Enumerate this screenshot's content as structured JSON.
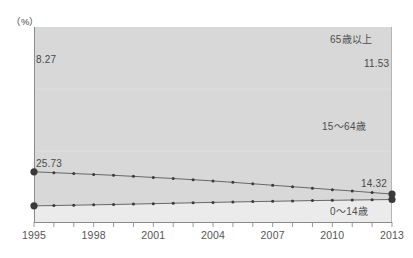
{
  "chart_data": {
    "type": "line",
    "title": "",
    "subtitle": "",
    "xlabel": "",
    "ylabel": "",
    "unit_label": "（%）",
    "grid": false,
    "legend_position": "inline-annotation",
    "x": [
      1995,
      1996,
      1997,
      1998,
      1999,
      2000,
      2001,
      2002,
      2003,
      2004,
      2005,
      2006,
      2007,
      2008,
      2009,
      2010,
      2011,
      2012,
      2013
    ],
    "xlim": [
      1995,
      2013
    ],
    "ylim": [
      0,
      100
    ],
    "tick_labels": [
      "1995",
      "1998",
      "2001",
      "2004",
      "2007",
      "2010",
      "2013"
    ],
    "tick_years": [
      1995,
      1998,
      2001,
      2004,
      2007,
      2010,
      2013
    ],
    "series": [
      {
        "name": "65歳以上",
        "values": [
          8.27,
          8.45,
          8.62,
          8.8,
          8.98,
          9.18,
          9.4,
          9.62,
          9.85,
          10.05,
          10.25,
          10.45,
          10.62,
          10.8,
          10.98,
          11.12,
          11.26,
          11.4,
          11.53
        ],
        "start_label": "8.27",
        "end_label": "11.53"
      },
      {
        "name": "0～14歳",
        "values": [
          25.73,
          25.3,
          24.85,
          24.42,
          23.95,
          23.4,
          22.85,
          22.3,
          21.7,
          21.05,
          20.35,
          19.6,
          18.85,
          18.1,
          17.35,
          16.6,
          15.9,
          15.1,
          14.32
        ],
        "start_label": "25.73",
        "end_label": "14.32"
      }
    ],
    "middle_band_label": "15～64歳",
    "colors": {
      "line": "#5a5a5a",
      "marker": "#3a3a3a",
      "plot_background": "#ebebeb",
      "upper_band": "#d9d9d9",
      "axis": "#8a8a8a"
    }
  },
  "annotations": {
    "series_65_plus": "65歳以上",
    "series_15_64": "15～64歳",
    "series_0_14": "0～14歳",
    "value_65_start": "8.27",
    "value_65_end": "11.53",
    "value_014_start": "25.73",
    "value_014_end": "14.32",
    "unit": "（%）"
  },
  "axis": {
    "x_tick_labels": [
      "1995",
      "1998",
      "2001",
      "2004",
      "2007",
      "2010",
      "2013"
    ]
  }
}
